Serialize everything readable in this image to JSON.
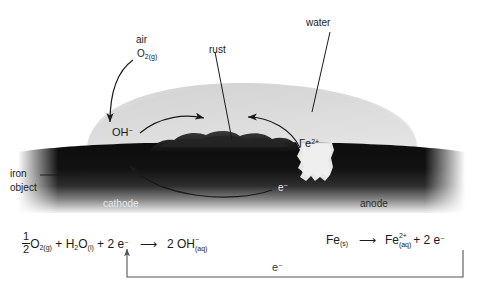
{
  "diagram": {
    "background_color": "#ffffff",
    "ink_color": "#1a1a1a",
    "water_color": "#dcdcdc",
    "iron_color": "#111111",
    "rust_color": "#2a2a2a"
  },
  "labels": {
    "air": "air",
    "air_formula_main": "O",
    "air_formula_sub": "2(g)",
    "rust": "rust",
    "water": "water",
    "hydroxide_main": "OH",
    "hydroxide_sup": "−",
    "ferrous_main": "Γe",
    "ferrous_sup": "2+",
    "iron_line1": "iron",
    "iron_line2": "object",
    "electron_main": "e",
    "electron_sup": "−",
    "cathode": "cathode",
    "anode": "anode"
  },
  "equations": {
    "cathode": {
      "half_num": "1",
      "half_den": "2",
      "o2_main": "O",
      "o2_sub": "2(g)",
      "plus1": "+",
      "h2o_h": "H",
      "h2o_h_sub": "2",
      "h2o_o": "O",
      "h2o_o_sub": "(l)",
      "plus2": "+",
      "two_e": "2 e",
      "e_sup": "−",
      "arrow": "⟶",
      "product_count": "2 OH",
      "product_sup": "−",
      "product_sub": "(aq)"
    },
    "anode": {
      "reactant": "Fe",
      "reactant_sub": "(s)",
      "arrow": "⟶",
      "product": "Fe",
      "product_sup": "2+",
      "product_sub": "(aq)",
      "plus": "+",
      "two_e": "2 e",
      "e_sup": "−"
    },
    "circuit": {
      "electron_main": "e",
      "electron_sup": "−"
    }
  },
  "annotations": {
    "oxygen_arrow": "curved-arrow-air-to-droplet",
    "hydroxide_arrow": "curved-arrow-hydroxide-to-rust",
    "ferrous_arrow": "curved-arrow-ferrous-to-rust",
    "electron_arrow": "curved-arrow-electron-anode-to-cathode",
    "rust_leader": "leader-line-rust",
    "water_leader": "leader-line-water",
    "iron_leader": "leader-line-iron-object",
    "circuit_arrow": "circuit-electron-return-path"
  }
}
